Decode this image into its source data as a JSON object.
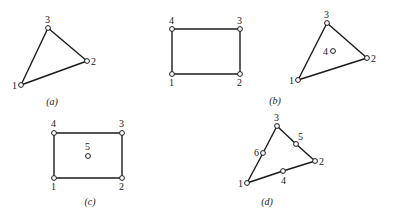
{
  "figures": [
    {
      "id": "a",
      "caption": "(a)",
      "caption_pos": [
        52,
        105
      ],
      "shape": "triangle",
      "edges": [
        [
          1,
          2
        ],
        [
          2,
          3
        ],
        [
          3,
          1
        ]
      ],
      "nodes": [
        {
          "label": "1",
          "x": 21,
          "y": 85,
          "lx": 12,
          "ly": 89
        },
        {
          "label": "2",
          "x": 87,
          "y": 61,
          "lx": 91,
          "ly": 65
        },
        {
          "label": "3",
          "x": 48,
          "y": 28,
          "lx": 45,
          "ly": 23
        }
      ]
    },
    {
      "id": "b-quad",
      "caption": "",
      "shape": "quadrilateral",
      "edges": [
        [
          1,
          2
        ],
        [
          2,
          3
        ],
        [
          3,
          4
        ],
        [
          4,
          1
        ]
      ],
      "nodes": [
        {
          "label": "1",
          "x": 172,
          "y": 74,
          "lx": 169,
          "ly": 86
        },
        {
          "label": "2",
          "x": 240,
          "y": 74,
          "lx": 237,
          "ly": 86
        },
        {
          "label": "3",
          "x": 240,
          "y": 29,
          "lx": 237,
          "ly": 24
        },
        {
          "label": "4",
          "x": 172,
          "y": 29,
          "lx": 169,
          "ly": 24
        }
      ]
    },
    {
      "id": "b",
      "caption": "(b)",
      "caption_pos": [
        275,
        104
      ],
      "shape": "triangle",
      "edges": [
        [
          1,
          2
        ],
        [
          2,
          3
        ],
        [
          3,
          1
        ]
      ],
      "nodes": [
        {
          "label": "1",
          "x": 298,
          "y": 80,
          "lx": 289,
          "ly": 84
        },
        {
          "label": "2",
          "x": 367,
          "y": 58,
          "lx": 371,
          "ly": 62
        },
        {
          "label": "3",
          "x": 327,
          "y": 23,
          "lx": 324,
          "ly": 18
        },
        {
          "label": "4",
          "x": 333,
          "y": 51,
          "lx": 323,
          "ly": 55
        }
      ]
    },
    {
      "id": "c",
      "caption": "(c)",
      "caption_pos": [
        90,
        205
      ],
      "shape": "quadrilateral",
      "edges": [
        [
          1,
          2
        ],
        [
          2,
          3
        ],
        [
          3,
          4
        ],
        [
          4,
          1
        ]
      ],
      "nodes": [
        {
          "label": "1",
          "x": 54,
          "y": 178,
          "lx": 51,
          "ly": 190
        },
        {
          "label": "2",
          "x": 122,
          "y": 178,
          "lx": 119,
          "ly": 190
        },
        {
          "label": "3",
          "x": 122,
          "y": 133,
          "lx": 119,
          "ly": 127
        },
        {
          "label": "4",
          "x": 54,
          "y": 133,
          "lx": 51,
          "ly": 127
        },
        {
          "label": "5",
          "x": 88,
          "y": 156,
          "lx": 85,
          "ly": 150
        }
      ]
    },
    {
      "id": "d",
      "caption": "(d)",
      "caption_pos": [
        267,
        205
      ],
      "shape": "triangle",
      "edges": [
        [
          1,
          4
        ],
        [
          4,
          2
        ],
        [
          2,
          5
        ],
        [
          5,
          3
        ],
        [
          3,
          6
        ],
        [
          6,
          1
        ]
      ],
      "nodes": [
        {
          "label": "1",
          "x": 247,
          "y": 183,
          "lx": 238,
          "ly": 187
        },
        {
          "label": "2",
          "x": 315,
          "y": 161,
          "lx": 319,
          "ly": 165
        },
        {
          "label": "3",
          "x": 277,
          "y": 126,
          "lx": 274,
          "ly": 121
        },
        {
          "label": "4",
          "x": 283,
          "y": 171,
          "lx": 281,
          "ly": 184
        },
        {
          "label": "5",
          "x": 296,
          "y": 144,
          "lx": 298,
          "ly": 140
        },
        {
          "label": "6",
          "x": 263,
          "y": 153,
          "lx": 254,
          "ly": 156
        }
      ]
    }
  ]
}
